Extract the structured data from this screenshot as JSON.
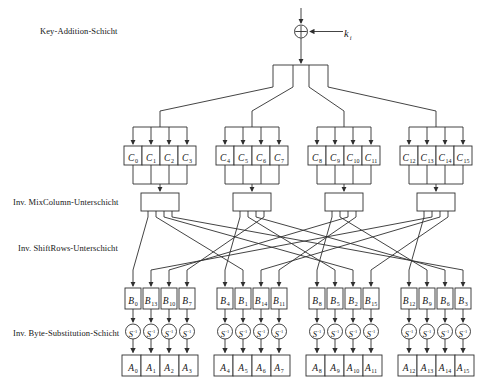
{
  "layers": [
    {
      "label": "Key-Addition-Schicht"
    },
    {
      "label": "Inv. MixColumn-Unterschicht"
    },
    {
      "label": "Inv. ShiftRows-Unterschicht"
    },
    {
      "label": "Inv. Byte-Substitution-Schicht"
    }
  ],
  "key_input": {
    "base": "k",
    "sub": "i"
  },
  "icons": {
    "xor": "xor-circle-plus",
    "arrow": "arrowhead-triangle"
  },
  "rows": {
    "c": {
      "base": "C",
      "subs": [
        "0",
        "1",
        "2",
        "3",
        "4",
        "5",
        "6",
        "7",
        "8",
        "9",
        "10",
        "11",
        "12",
        "13",
        "14",
        "15"
      ]
    },
    "mixcol": {
      "count": 4
    },
    "b": {
      "base": "B",
      "subs": [
        "0",
        "13",
        "10",
        "7",
        "4",
        "1",
        "14",
        "11",
        "8",
        "5",
        "2",
        "15",
        "12",
        "9",
        "6",
        "3"
      ]
    },
    "sbox": {
      "base": "S",
      "sup": "-1",
      "count": 16
    },
    "a": {
      "base": "A",
      "subs": [
        "0",
        "1",
        "2",
        "3",
        "4",
        "5",
        "6",
        "7",
        "8",
        "9",
        "10",
        "11",
        "12",
        "13",
        "14",
        "15"
      ]
    }
  },
  "colors": {
    "line": "#2f2f2f",
    "text": "#161616",
    "background": "#ffffff"
  }
}
